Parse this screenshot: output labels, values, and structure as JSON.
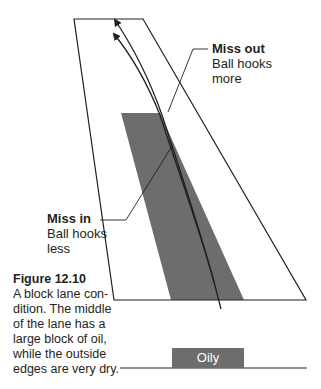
{
  "diagram": {
    "colors": {
      "oil": "#6d6d6d",
      "lane_stroke": "#231f20",
      "text": "#231f20",
      "legend_text": "#ffffff"
    },
    "annotations": {
      "miss_out": {
        "title": "Miss out",
        "lines": [
          "Ball hooks",
          "more"
        ]
      },
      "miss_in": {
        "title": "Miss in",
        "lines": [
          "Ball hooks",
          "less"
        ]
      }
    },
    "legend": {
      "oily_label": "Oily"
    }
  },
  "caption": {
    "title": "Figure 12.10",
    "lines": [
      "A block lane con-",
      "dition. The middle",
      "of the lane has a",
      "large block of oil,",
      "while the outside",
      "edges are very dry."
    ]
  }
}
